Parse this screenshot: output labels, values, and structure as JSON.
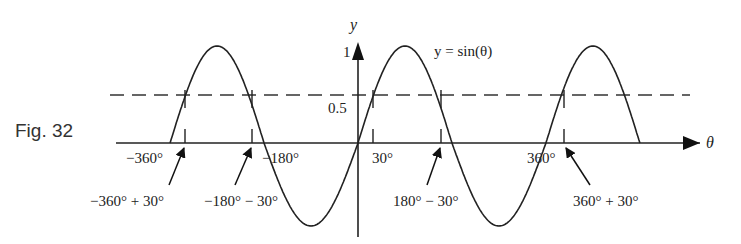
{
  "figure": {
    "label": "Fig. 32",
    "equation": "y = sin(θ)",
    "y_axis_label": "y",
    "x_axis_label": "θ",
    "y_ticks": {
      "one": "1",
      "half": "0.5"
    },
    "x_tick_labels": [
      "−360°",
      "−180°",
      "30°",
      "360°"
    ],
    "annotations": [
      "−360° + 30°",
      "−180° − 30°",
      "180° − 30°",
      "360° + 30°"
    ]
  },
  "chart_data": {
    "type": "line",
    "title": "y = sin(θ)",
    "xlabel": "θ",
    "ylabel": "y",
    "x_range_deg": [
      -360,
      540
    ],
    "y_range": [
      -1,
      1
    ],
    "series": [
      {
        "name": "y = sin(θ)",
        "function": "sin",
        "x_deg_start": -360,
        "x_deg_end": 540
      },
      {
        "name": "y = 0.5",
        "style": "dashed",
        "value": 0.5
      }
    ],
    "marked_solutions_deg": [
      -330,
      -210,
      30,
      150,
      390
    ],
    "tick_labels": [
      "−360°",
      "−180°",
      "30°",
      "360°"
    ],
    "y_tick_labels": [
      "0.5",
      "1"
    ],
    "annotations": [
      "−360° + 30°",
      "−180° − 30°",
      "180° − 30°",
      "360° + 30°"
    ]
  }
}
